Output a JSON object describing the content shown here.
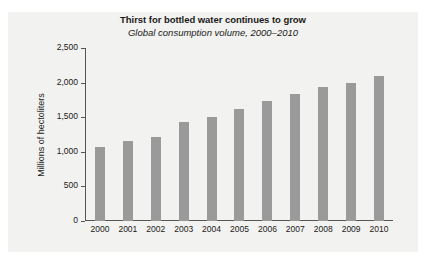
{
  "chart_data": {
    "type": "bar",
    "title": "Thirst for bottled water continues to grow",
    "subtitle": "Global consumption volume, 2000–2010",
    "xlabel": "",
    "ylabel": "Millions of hectoliters",
    "categories": [
      "2000",
      "2001",
      "2002",
      "2003",
      "2004",
      "2005",
      "2006",
      "2007",
      "2008",
      "2009",
      "2010"
    ],
    "values": [
      1075,
      1150,
      1210,
      1430,
      1500,
      1620,
      1740,
      1840,
      1930,
      2000,
      2100
    ],
    "ylim": [
      0,
      2500
    ],
    "ytick_labels": [
      "0",
      "500",
      "1,000",
      "1,500",
      "2,000",
      "2,500"
    ],
    "ytick_values": [
      0,
      500,
      1000,
      1500,
      2000,
      2500
    ],
    "grid": false,
    "legend": null,
    "bar_color": "#9a9a9a",
    "panel_color": "#f2f2f0",
    "axis_color": "#55565a"
  }
}
